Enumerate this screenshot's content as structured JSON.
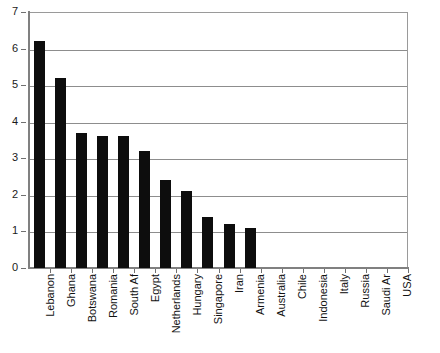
{
  "chart_data": {
    "type": "bar",
    "title": "",
    "subtitle": "",
    "xlabel": "",
    "ylabel": "",
    "ylim": [
      0,
      7
    ],
    "ytick_labels": [
      "0",
      "1",
      "2",
      "3",
      "4",
      "5",
      "6",
      "7"
    ],
    "ytick_values": [
      0,
      1,
      2,
      3,
      4,
      5,
      6,
      7
    ],
    "grid": true,
    "grid_axis": "y",
    "legend": false,
    "legend_position": "none",
    "bar_color": "#0d0d0d",
    "plot_border_color": "#9a9a9a",
    "gridline_color": "#8d8d8d",
    "axis_color": "#808080",
    "categories": [
      "Lebanon",
      "Ghana",
      "Botswana",
      "Romania",
      "South Af",
      "Egypt",
      "Netherlands",
      "Hungary",
      "Singapore",
      "Iran",
      "Armenia",
      "Australia",
      "Chile",
      "Indonesia",
      "Italy",
      "Russia",
      "Saudi Ar",
      "USA"
    ],
    "values": [
      6.2,
      5.2,
      3.7,
      3.6,
      3.6,
      3.2,
      2.4,
      2.1,
      1.4,
      1.2,
      1.1,
      0,
      0,
      0,
      0,
      0,
      0,
      0
    ]
  }
}
